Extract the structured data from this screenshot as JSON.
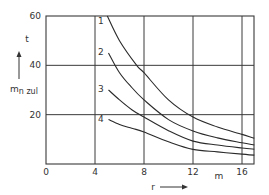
{
  "chart_data": {
    "type": "line",
    "title": "",
    "xlabel": "r",
    "x_unit": "m",
    "ylabel": "m_n zul",
    "ylabel_main": "m",
    "ylabel_sub": "n zul",
    "y_unit": "t",
    "xlim": [
      0,
      17
    ],
    "ylim": [
      0,
      60
    ],
    "grid": true,
    "x_ticks": [
      0,
      4,
      8,
      12,
      16
    ],
    "y_ticks": [
      20,
      40,
      60
    ],
    "x_tick_labels": [
      "0",
      "4",
      "8",
      "12",
      "16"
    ],
    "y_tick_labels": [
      "20",
      "40",
      "60"
    ],
    "legend": "inline labels at curve starts",
    "series": [
      {
        "name": "1",
        "x": [
          5.0,
          6.0,
          7.4,
          8.0,
          10.0,
          12.0,
          14.0,
          16.0,
          17.0
        ],
        "values": [
          60,
          50,
          40,
          37,
          26,
          19,
          15,
          12,
          10.4
        ]
      },
      {
        "name": "2",
        "x": [
          5.1,
          6.0,
          7.0,
          8.0,
          10.0,
          12.0,
          14.0,
          16.0,
          17.0
        ],
        "values": [
          45,
          37,
          31,
          26,
          18,
          13.4,
          10.6,
          8.6,
          7.7
        ]
      },
      {
        "name": "3",
        "x": [
          5.1,
          6.0,
          7.0,
          8.0,
          10.0,
          12.0,
          14.0,
          16.0,
          17.0
        ],
        "values": [
          30,
          26,
          22,
          19,
          13.5,
          9.3,
          7.7,
          6.5,
          6.0
        ]
      },
      {
        "name": "4",
        "x": [
          5.1,
          6.0,
          7.0,
          8.0,
          10.0,
          12.0,
          14.0,
          16.0,
          17.0
        ],
        "values": [
          18,
          16,
          14.5,
          13,
          9,
          5.9,
          4.9,
          4.0,
          3.6
        ]
      }
    ]
  }
}
